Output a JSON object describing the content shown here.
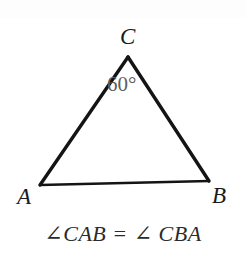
{
  "figure": {
    "type": "geometry-diagram",
    "shape": "triangle",
    "background_color": "#ffffff",
    "stroke_color": "#141414",
    "vertices": [
      {
        "name": "C",
        "label": "C",
        "x": 128,
        "y": 57,
        "label_x": 120,
        "label_y": 25
      },
      {
        "name": "A",
        "label": "A",
        "x": 40,
        "y": 185,
        "label_x": 17,
        "label_y": 185
      },
      {
        "name": "B",
        "label": "B",
        "x": 209,
        "y": 181,
        "label_x": 212,
        "label_y": 184
      }
    ],
    "angle_annotation": {
      "value": "60°",
      "at_vertex": "C",
      "color": "#5e5e5e"
    },
    "caption": "∠CAB = ∠ CBA"
  }
}
